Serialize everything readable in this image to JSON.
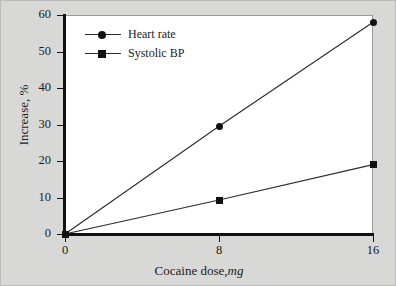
{
  "chart_data": {
    "type": "line",
    "title": "",
    "subtitle": "",
    "xlabel": "Cocaine dose,",
    "xlabel_unit": "mg",
    "ylabel": "Increase, %",
    "x": [
      0,
      8,
      16
    ],
    "xticks": [
      "0",
      "8",
      "16"
    ],
    "xtick_values": [
      0,
      8,
      16
    ],
    "xlim": [
      0,
      16
    ],
    "yticks": [
      "0",
      "10",
      "20",
      "30",
      "40",
      "50",
      "60"
    ],
    "ytick_values": [
      0,
      10,
      20,
      30,
      40,
      50,
      60
    ],
    "ylim": [
      0,
      60
    ],
    "grid": false,
    "legend_position": "upper-left-inside",
    "series": [
      {
        "name": "Heart rate",
        "marker": "circle",
        "values": [
          0,
          29.5,
          58.0
        ]
      },
      {
        "name": "Systolic BP",
        "marker": "square",
        "values": [
          0,
          9.3,
          19.0
        ]
      }
    ],
    "colors": {
      "line": "#2b2b2b",
      "marker": "#111111",
      "axis": "#111111",
      "plot_background": "#ffffff",
      "figure_background": "#d8d8d6",
      "text": "#1b1b1b"
    }
  }
}
